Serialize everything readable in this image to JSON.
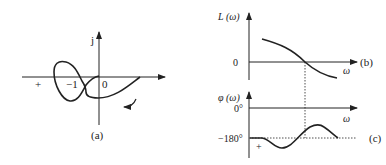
{
  "figure_a": {
    "caption": "(a)",
    "y_axis_label": "j",
    "plus_label": "+",
    "minus_one_label": "−1",
    "origin_label": "0",
    "description": "Nyquist plot forming a loop around the −1 point, with a direction arrow below the curve"
  },
  "figure_b": {
    "caption": "(b)",
    "y_axis_label": "L (ω)",
    "zero_label": "0",
    "x_axis_label": "ω",
    "description": "Log-magnitude curve decreasing, crossing 0 dB at the crossover frequency"
  },
  "figure_c": {
    "caption": "(c)",
    "y_axis_label": "φ (ω)",
    "zero_deg_label": "0°",
    "minus180_label": "−180°",
    "x_axis_label": "ω",
    "plus_label": "+",
    "description": "Phase curve dipping below then rising above −180°, with crossing marked"
  },
  "colors": {
    "stroke": "#222222",
    "background": "#ffffff"
  }
}
